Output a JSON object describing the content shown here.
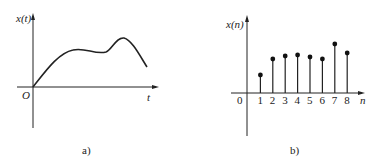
{
  "figure_a": {
    "y_label": "x(t)",
    "x_label": "t",
    "origin_label": "O",
    "caption": "a)",
    "description": "continuous-time signal"
  },
  "figure_b": {
    "y_label": "x(n)",
    "x_label": "n",
    "origin_label": "0",
    "caption": "b)",
    "description": "discrete-time signal"
  },
  "chart_data": [
    {
      "type": "line",
      "title": "a)",
      "xlabel": "t",
      "ylabel": "x(t)",
      "x": [
        0,
        1,
        2,
        3,
        4,
        5,
        6,
        7
      ],
      "values": [
        0,
        0.6,
        0.98,
        0.92,
        0.88,
        1.22,
        0.75,
        0.5
      ],
      "grid": false
    },
    {
      "type": "scatter",
      "style": "stem",
      "title": "b)",
      "xlabel": "n",
      "ylabel": "x(n)",
      "categories": [
        "0",
        "1",
        "2",
        "3",
        "4",
        "5",
        "6",
        "7",
        "8"
      ],
      "x": [
        1,
        2,
        3,
        4,
        5,
        6,
        7,
        8
      ],
      "values": [
        0.36,
        0.68,
        0.74,
        0.76,
        0.72,
        0.68,
        0.98,
        0.8
      ],
      "grid": false
    }
  ]
}
